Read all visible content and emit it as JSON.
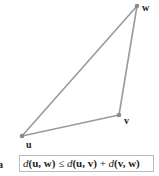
{
  "diagram": {
    "type": "triangle",
    "line_color": "#9a9a9a",
    "point_color": "#8a8a8a",
    "points": [
      {
        "id": "u",
        "label": "u",
        "x": 22,
        "y": 136,
        "label_x": 26,
        "label_y": 148
      },
      {
        "id": "v",
        "label": "v",
        "x": 119,
        "y": 115,
        "label_x": 124,
        "label_y": 124
      },
      {
        "id": "w",
        "label": "w",
        "x": 137,
        "y": 6,
        "label_x": 143,
        "label_y": 12
      }
    ],
    "edges": [
      [
        "u",
        "v"
      ],
      [
        "v",
        "w"
      ],
      [
        "u",
        "w"
      ]
    ]
  },
  "formula": {
    "d1": "d",
    "args1": "(u, w)",
    "relation": " ≤ ",
    "d2": "d",
    "args2": "(u, v)",
    "plus": " + ",
    "d3": "d",
    "args3": "(v, w)"
  },
  "partial_label": "a"
}
